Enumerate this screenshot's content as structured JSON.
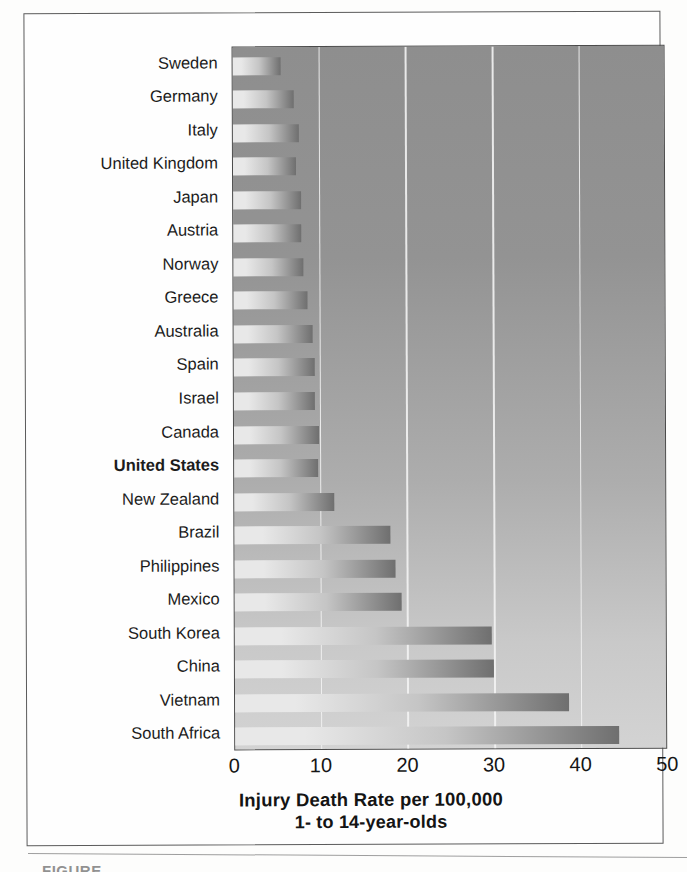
{
  "figure": {
    "frame_border_color": "#5b5b5b",
    "page_background": "#ffffff",
    "caption_fragment": "FIGURE"
  },
  "chart_data": {
    "type": "bar",
    "orientation": "horizontal",
    "title": "",
    "xlabel": "Injury Death Rate per 100,000",
    "xlabel_line2": "1- to 14-year-olds",
    "ylabel": "",
    "xlim": [
      0,
      50
    ],
    "xticks": [
      0,
      10,
      20,
      30,
      40,
      50
    ],
    "xtick_labels": [
      "0",
      "10",
      "20",
      "30",
      "40",
      "50"
    ],
    "grid": true,
    "grid_axis": "x",
    "grid_color": "#f3f3f3",
    "legend": "none",
    "plot_background": "#9a9a9a",
    "bar_gradient_light": "#e8e8e8",
    "bar_gradient_dark": "#6f6f6f",
    "highlight_category": "United States",
    "categories": [
      "Sweden",
      "Germany",
      "Italy",
      "United Kingdom",
      "Japan",
      "Austria",
      "Norway",
      "Greece",
      "Australia",
      "Spain",
      "Israel",
      "Canada",
      "United States",
      "New Zealand",
      "Brazil",
      "Philippines",
      "Mexico",
      "South Korea",
      "China",
      "Vietnam",
      "South Africa"
    ],
    "values": [
      5.5,
      7.1,
      7.6,
      7.3,
      7.9,
      7.9,
      8.1,
      8.5,
      9.1,
      9.4,
      9.4,
      9.8,
      9.7,
      11.6,
      18.0,
      18.6,
      19.3,
      29.7,
      29.9,
      38.6,
      44.3
    ]
  }
}
